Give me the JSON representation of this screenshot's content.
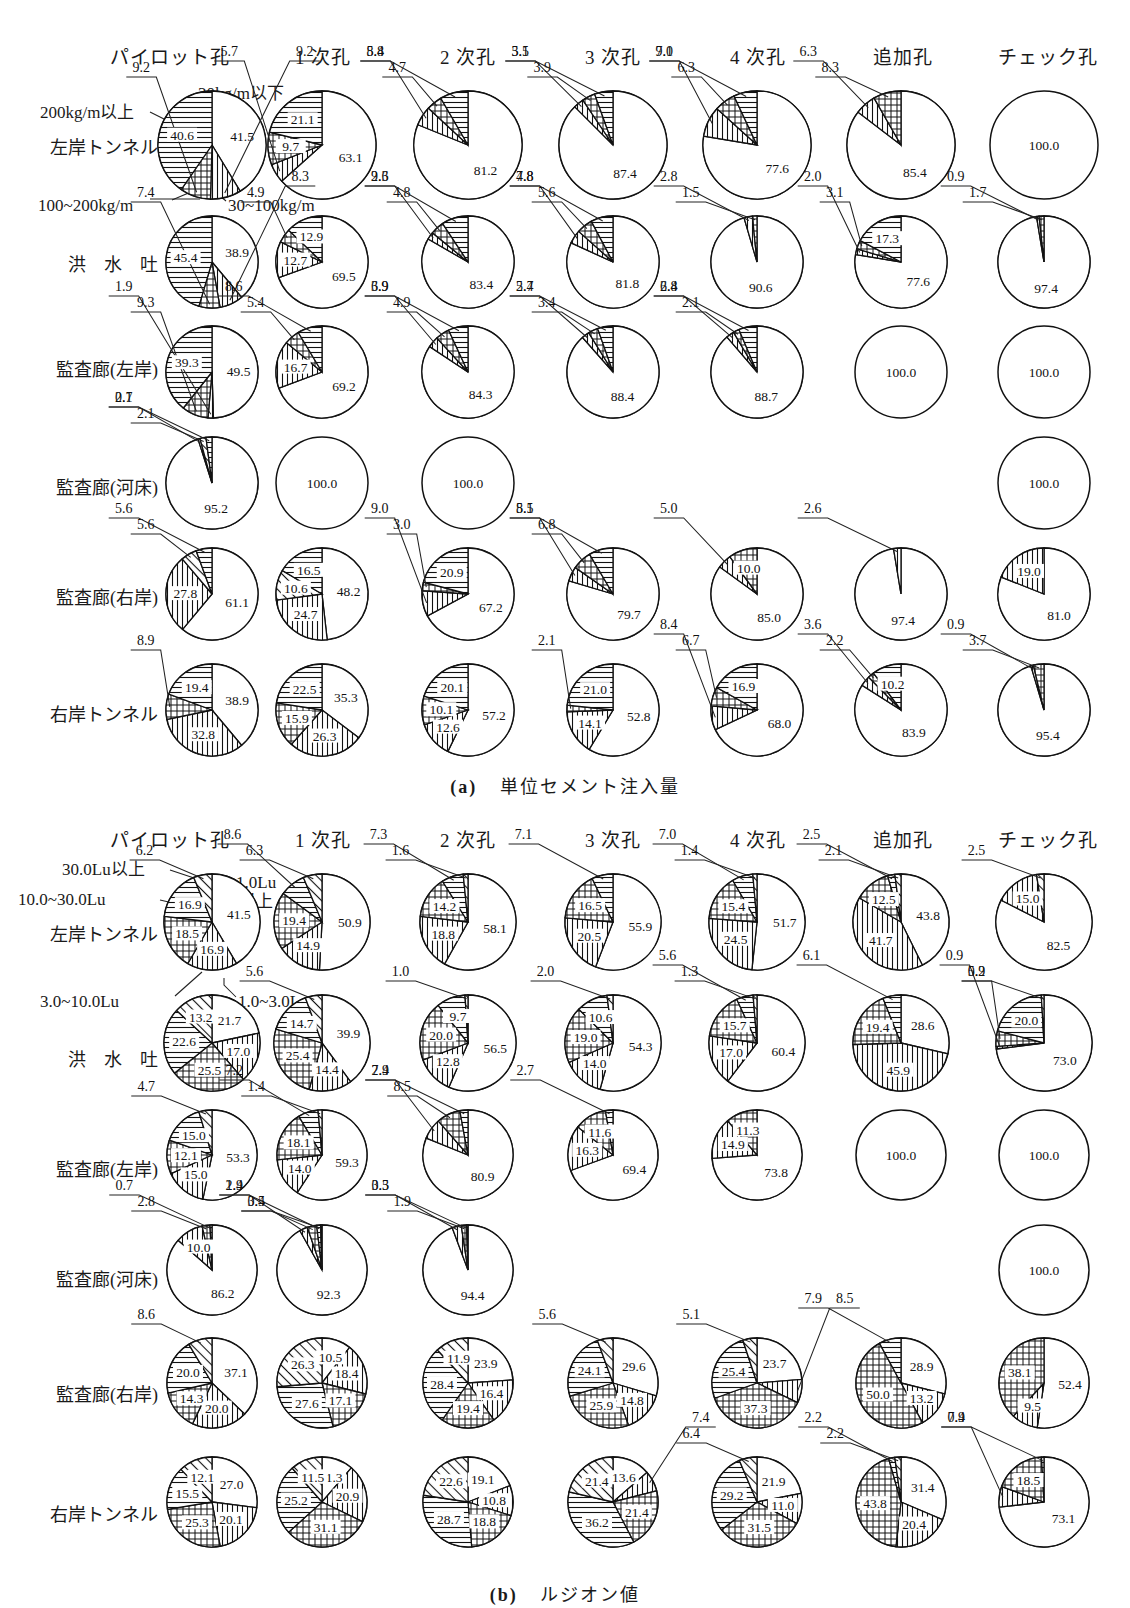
{
  "figure": {
    "panels": [
      {
        "id": "a",
        "caption_tag": "(a)",
        "caption_text": "単位セメント注入量",
        "legend": {
          "cat1": "30kg/m以下",
          "cat2": "30~100kg/m",
          "cat3": "100~200kg/m",
          "cat4": "200kg/m以上"
        },
        "columns": [
          "パイロット孔",
          "1 次孔",
          "2 次孔",
          "3 次孔",
          "4 次孔",
          "追加孔",
          "チェック孔"
        ],
        "rows": [
          "左岸トンネル",
          "洪　水　吐",
          "監査廊(左岸)",
          "監査廊(河床)",
          "監査廊(右岸)",
          "右岸トンネル"
        ],
        "data": [
          [
            [
              41.5,
              9.2,
              9.2,
              40.6
            ],
            [
              63.1,
              5.7,
              9.7,
              21.1
            ],
            [
              81.2,
              5.8,
              4.7,
              8.4
            ],
            [
              87.4,
              3.1,
              3.9,
              5.5
            ],
            [
              77.6,
              9.1,
              6.3,
              7.0
            ],
            [
              85.4,
              6.3,
              8.3,
              null
            ],
            [
              100.0,
              null,
              null,
              null
            ]
          ],
          [
            [
              38.9,
              8.3,
              7.4,
              45.4
            ],
            [
              69.5,
              12.7,
              4.9,
              12.9
            ],
            [
              83.4,
              2.6,
              4.8,
              9.3
            ],
            [
              81.8,
              4.8,
              5.6,
              7.8
            ],
            [
              90.6,
              2.8,
              1.5,
              null
            ],
            [
              77.6,
              2.0,
              3.1,
              17.3
            ],
            [
              97.4,
              0.9,
              1.7,
              null
            ]
          ],
          [
            [
              49.5,
              1.9,
              9.3,
              39.3
            ],
            [
              69.2,
              16.7,
              5.4,
              8.6
            ],
            [
              84.3,
              3.9,
              4.9,
              6.9
            ],
            [
              88.4,
              2.7,
              3.4,
              5.4
            ],
            [
              88.7,
              2.8,
              2.1,
              6.4
            ],
            [
              100.0,
              null,
              null,
              null
            ],
            [
              100.0,
              null,
              null,
              null
            ]
          ],
          [
            [
              95.2,
              0.7,
              2.1,
              2.1
            ],
            [
              100.0,
              null,
              null,
              null
            ],
            [
              100.0,
              null,
              null,
              null
            ],
            [
              null,
              null,
              null,
              null
            ],
            [
              null,
              null,
              null,
              null
            ],
            [
              null,
              null,
              null,
              null
            ],
            [
              100.0,
              null,
              null,
              null
            ]
          ],
          [
            [
              61.1,
              27.8,
              5.6,
              5.6
            ],
            [
              48.2,
              24.7,
              10.6,
              16.5
            ],
            [
              67.2,
              9.0,
              3.0,
              20.9
            ],
            [
              79.7,
              5.1,
              6.8,
              8.5
            ],
            [
              85.0,
              5.0,
              10.0,
              null
            ],
            [
              97.4,
              2.6,
              null,
              null
            ],
            [
              81.0,
              19.0,
              null,
              null
            ]
          ],
          [
            [
              38.9,
              32.8,
              8.9,
              19.4
            ],
            [
              35.3,
              26.3,
              15.9,
              22.5
            ],
            [
              57.2,
              12.6,
              10.1,
              20.1
            ],
            [
              52.8,
              14.1,
              2.1,
              21.0
            ],
            [
              68.0,
              8.4,
              6.7,
              16.9
            ],
            [
              83.9,
              3.6,
              2.2,
              10.2
            ],
            [
              95.4,
              0.9,
              3.7,
              null
            ]
          ]
        ]
      },
      {
        "id": "b",
        "caption_tag": "(b)",
        "caption_text": "ルジオン値",
        "legend": {
          "cat1": "1.0Lu",
          "cat1b": "以上",
          "cat2": "1.0~3.0Lu",
          "cat3": "3.0~10.0Lu",
          "cat4": "10.0~30.0Lu",
          "cat5": "30.0Lu以上"
        },
        "columns": [
          "パイロット孔",
          "1 次孔",
          "2 次孔",
          "3 次孔",
          "4 次孔",
          "追加孔",
          "チェック孔"
        ],
        "rows": [
          "左岸トンネル",
          "洪　水　吐",
          "監査廊(左岸)",
          "監査廊(河床)",
          "監査廊(右岸)",
          "右岸トンネル"
        ],
        "data": [
          [
            [
              41.5,
              16.9,
              18.5,
              16.9,
              6.2
            ],
            [
              50.9,
              14.9,
              19.4,
              8.6,
              6.3
            ],
            [
              58.1,
              18.8,
              14.2,
              7.3,
              1.6
            ],
            [
              55.9,
              20.5,
              16.5,
              7.1,
              null
            ],
            [
              51.7,
              24.5,
              15.4,
              7.0,
              1.4
            ],
            [
              43.8,
              41.7,
              12.5,
              2.5,
              2.1
            ],
            [
              82.5,
              15.0,
              null,
              null,
              2.5
            ]
          ],
          [
            [
              21.7,
              17.0,
              25.5,
              22.6,
              13.2
            ],
            [
              39.9,
              14.4,
              25.4,
              14.7,
              5.6
            ],
            [
              56.5,
              12.8,
              20.0,
              9.7,
              1.0
            ],
            [
              54.3,
              14.0,
              19.0,
              10.6,
              2.0
            ],
            [
              60.4,
              17.0,
              15.7,
              5.6,
              1.3
            ],
            [
              28.6,
              45.9,
              19.4,
              6.1,
              null
            ],
            [
              73.0,
              0.9,
              5.2,
              20.0,
              0.9
            ]
          ],
          [
            [
              53.3,
              15.0,
              12.1,
              15.0,
              4.7
            ],
            [
              59.3,
              14.0,
              18.1,
              7.2,
              1.4
            ],
            [
              80.9,
              7.4,
              8.5,
              2.9,
              null
            ],
            [
              69.4,
              16.3,
              11.6,
              2.7,
              null
            ],
            [
              73.8,
              14.9,
              11.3,
              null,
              null
            ],
            [
              100.0,
              null,
              null,
              null,
              null
            ],
            [
              100.0,
              null,
              null,
              null,
              null
            ]
          ],
          [
            [
              86.2,
              10.0,
              2.8,
              0.7,
              null
            ],
            [
              92.3,
              2.9,
              3.4,
              1.4,
              0.5
            ],
            [
              94.4,
              3.3,
              1.9,
              0.5,
              null
            ],
            [
              null,
              null,
              null,
              null,
              null
            ],
            [
              null,
              null,
              null,
              null,
              null
            ],
            [
              null,
              null,
              null,
              null,
              null
            ],
            [
              100.0,
              null,
              null,
              null,
              null
            ]
          ],
          [
            [
              37.1,
              20.0,
              14.3,
              20.0,
              8.6
            ],
            [
              10.5,
              18.4,
              17.1,
              27.6,
              26.3
            ],
            [
              23.9,
              16.4,
              19.4,
              28.4,
              11.9
            ],
            [
              29.6,
              14.8,
              25.9,
              24.1,
              5.6
            ],
            [
              23.7,
              8.5,
              37.3,
              25.4,
              5.1
            ],
            [
              28.9,
              13.2,
              50.0,
              7.9,
              null
            ],
            [
              52.4,
              9.5,
              38.1,
              null,
              null
            ]
          ],
          [
            [
              27.0,
              20.1,
              25.3,
              15.5,
              12.1
            ],
            [
              11.3,
              20.9,
              31.1,
              25.2,
              11.5
            ],
            [
              19.1,
              10.8,
              18.8,
              28.7,
              22.6
            ],
            [
              13.6,
              7.4,
              21.4,
              36.2,
              21.4
            ],
            [
              21.9,
              11.0,
              31.5,
              29.2,
              6.4
            ],
            [
              31.4,
              20.4,
              43.8,
              2.2,
              2.2
            ],
            [
              73.1,
              7.4,
              18.5,
              0.9,
              null
            ]
          ]
        ]
      }
    ]
  }
}
